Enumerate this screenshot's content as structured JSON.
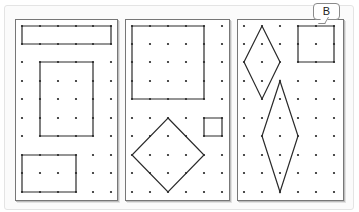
{
  "figure": {
    "label": "B",
    "dot_color": "#222222",
    "line_color": "#2a2a2a",
    "grid": {
      "columns": 6,
      "rows": 10,
      "panel_1_x": [
        22,
        40,
        58,
        76,
        93,
        111
      ],
      "panel_2_x": [
        132,
        150,
        168,
        186,
        204,
        222
      ],
      "panel_3_x": [
        244,
        262,
        280,
        298,
        316,
        334
      ],
      "y": [
        26,
        44,
        62,
        81,
        99,
        118,
        136,
        155,
        173,
        192
      ]
    },
    "panels": [
      {
        "name": "panel-1",
        "shapes": [
          {
            "type": "rectangle",
            "cols": [
              0,
              5
            ],
            "rows": [
              0,
              1
            ]
          },
          {
            "type": "rectangle",
            "cols": [
              1,
              4
            ],
            "rows": [
              2,
              6
            ]
          },
          {
            "type": "rectangle",
            "cols": [
              0,
              3
            ],
            "rows": [
              7,
              9
            ]
          }
        ]
      },
      {
        "name": "panel-2",
        "shapes": [
          {
            "type": "square",
            "cols": [
              0,
              4
            ],
            "rows": [
              0,
              4
            ]
          },
          {
            "type": "square",
            "cols": [
              4,
              5
            ],
            "rows": [
              5,
              6
            ]
          },
          {
            "type": "diamond",
            "points": [
              [
                2,
                5
              ],
              [
                4,
                7
              ],
              [
                2,
                9
              ],
              [
                0,
                7
              ]
            ]
          }
        ]
      },
      {
        "name": "panel-3",
        "shapes": [
          {
            "type": "rhombus",
            "points": [
              [
                1,
                0
              ],
              [
                2,
                2
              ],
              [
                1,
                4
              ],
              [
                0,
                2
              ]
            ]
          },
          {
            "type": "square",
            "cols": [
              3,
              5
            ],
            "rows": [
              0,
              2
            ]
          },
          {
            "type": "rhombus",
            "points": [
              [
                2,
                3
              ],
              [
                3,
                6
              ],
              [
                2,
                9
              ],
              [
                1,
                6
              ]
            ]
          }
        ]
      }
    ]
  }
}
